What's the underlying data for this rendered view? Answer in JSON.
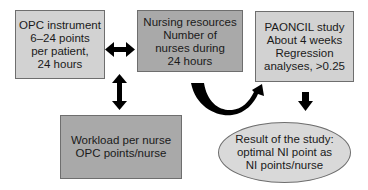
{
  "diagram": {
    "nodes": {
      "opc_instrument": {
        "lines": [
          "OPC instrument",
          "6–24 points",
          "per patient,",
          "24 hours"
        ],
        "fill": "#d2d2d2"
      },
      "nursing_resources": {
        "lines": [
          "Nursing resources",
          "Number of",
          "nurses during",
          "24 hours"
        ],
        "fill": "#a9a9a9"
      },
      "paoncil_study": {
        "lines": [
          "PAONCIL study",
          "About 4 weeks",
          "Regression",
          "analyses, >0.25"
        ],
        "fill": "#d2d2d2"
      },
      "workload": {
        "lines": [
          "Workload per nurse",
          "OPC points/nurse"
        ],
        "fill": "#a9a9a9"
      },
      "result": {
        "lines": [
          "Result of the study:",
          "optimal NI point as",
          "NI points/nurse"
        ],
        "fill": "#d9d9d9",
        "shape": "ellipse"
      }
    },
    "edges": [
      {
        "from": "opc_instrument",
        "to": "nursing_resources",
        "type": "double-arrow"
      },
      {
        "from": "opc_instrument",
        "to": "workload",
        "type": "double-arrow"
      },
      {
        "from": "nursing_resources",
        "to": "paoncil_study",
        "type": "curved-arrow"
      },
      {
        "from": "paoncil_study",
        "to": "result",
        "type": "arrow"
      }
    ]
  }
}
